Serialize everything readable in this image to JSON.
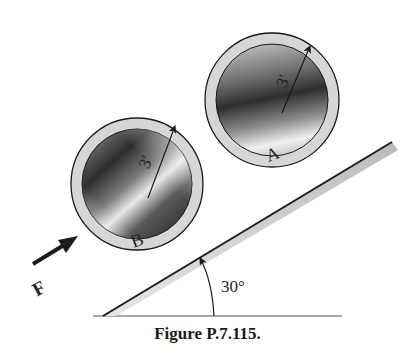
{
  "figure": {
    "caption": "Figure P.7.115.",
    "incline_angle_label": "30°",
    "force_label": "F",
    "cylinders": [
      {
        "id": "A",
        "label": "A",
        "radius_label": "3′"
      },
      {
        "id": "B",
        "label": "B",
        "radius_label": "3′"
      }
    ]
  },
  "colors": {
    "line": "#1a1a1a",
    "rim": "#d9d9d9",
    "surface_shade": "#c8c8c8",
    "dark_core": "#3a3a3a"
  }
}
